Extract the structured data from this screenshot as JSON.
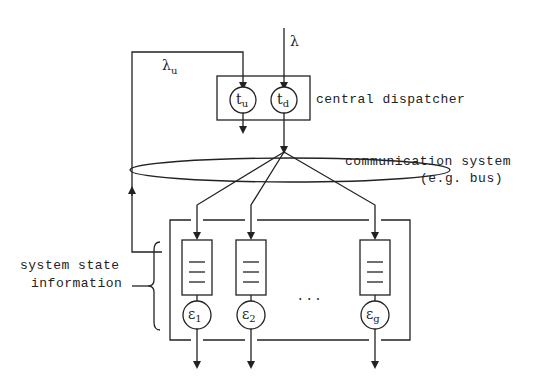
{
  "labels": {
    "arrival_rate": "λ",
    "update_rate": "λ",
    "update_rate_sub": "u",
    "dispatcher": "central dispatcher",
    "comm_line1": "communication system",
    "comm_line2": "(e.g. bus)",
    "state_line1": "system state",
    "state_line2": "information",
    "ellipsis": ". . ."
  },
  "dispatcher_nodes": [
    {
      "symbol": "t",
      "sub": "u"
    },
    {
      "symbol": "t",
      "sub": "d"
    }
  ],
  "servers": [
    {
      "symbol": "ε",
      "sub": "1"
    },
    {
      "symbol": "ε",
      "sub": "2"
    },
    {
      "symbol": "ε",
      "sub": "g"
    }
  ],
  "colors": {
    "stroke": "#222222",
    "background": "#ffffff"
  }
}
